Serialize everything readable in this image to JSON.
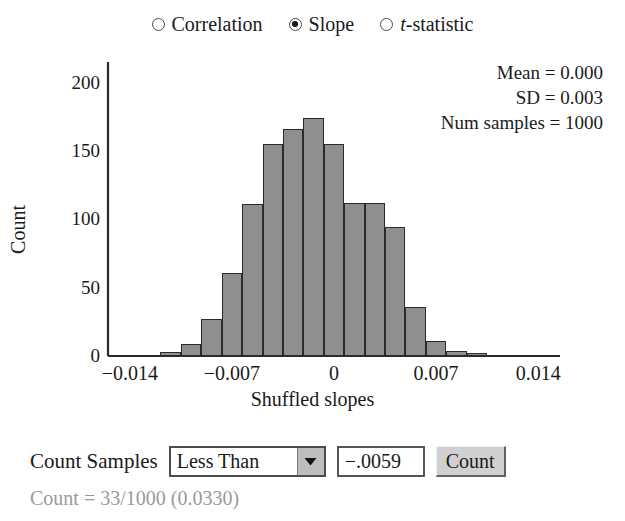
{
  "statistic_selector": {
    "options": [
      {
        "label": "Correlation",
        "italic_first_char": false,
        "selected": false
      },
      {
        "label": "Slope",
        "italic_first_char": false,
        "selected": true
      },
      {
        "label": "t-statistic",
        "italic_first_char": true,
        "selected": false
      }
    ]
  },
  "stats_panel": {
    "mean_line": "Mean = 0.000",
    "sd_line": "SD = 0.003",
    "num_samples_line": "Num samples = 1000"
  },
  "controls": {
    "count_samples_label": "Count Samples",
    "operator_value": "Less Than",
    "operator_options": [
      "Less Than",
      "Greater Than",
      "Between",
      "Beyond"
    ],
    "dropdown_arrow": "▼",
    "threshold_value": "−.0059",
    "count_button_label": "Count",
    "result_text": "Count = 33/1000 (0.0330)"
  },
  "chart_data": {
    "type": "bar",
    "title": "",
    "subtitle": "",
    "xlabel": "Shuffled slopes",
    "ylabel": "Count",
    "xlim": [
      -0.0155,
      0.0155
    ],
    "ylim": [
      0,
      215
    ],
    "grid": false,
    "legend_position": "none",
    "x_tick_labels": [
      "−0.014",
      "−0.007",
      "0",
      "0.007",
      "0.014"
    ],
    "x_tick_values": [
      -0.014,
      -0.007,
      0,
      0.007,
      0.014
    ],
    "y_tick_labels": [
      "0",
      "50",
      "100",
      "150",
      "200"
    ],
    "y_tick_values": [
      0,
      50,
      100,
      150,
      200
    ],
    "bin_width": 0.0014,
    "bin_centers": [
      -0.0126,
      -0.0112,
      -0.0098,
      -0.0084,
      -0.007,
      -0.0056,
      -0.0042,
      -0.0028,
      -0.0014,
      0.0,
      0.0014,
      0.0028,
      0.0042,
      0.0056,
      0.007,
      0.0084,
      0.0098
    ],
    "values": [
      1,
      3,
      9,
      27,
      61,
      111,
      155,
      166,
      174,
      155,
      112,
      112,
      94,
      36,
      11,
      4,
      2
    ],
    "bar_color": "#8f8f8f",
    "bar_edge_color": "#2b2b2b",
    "annotations": [
      "Mean = 0.000",
      "SD = 0.003",
      "Num samples = 1000"
    ]
  }
}
